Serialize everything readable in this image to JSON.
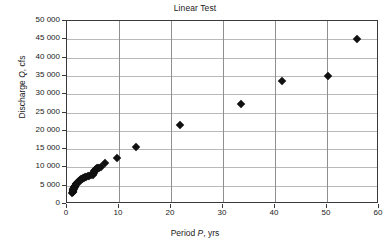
{
  "chart_data": {
    "type": "scatter",
    "title": "Linear Test",
    "xlabel": "Period P, yrs",
    "xlabel_parts": {
      "pre": "Period ",
      "italic": "P",
      "post": ", yrs"
    },
    "ylabel": "Discharge Q, cfs",
    "ylabel_parts": {
      "pre": "Discharge ",
      "italic": "Q",
      "post": ", cfs"
    },
    "xlim": [
      0,
      60
    ],
    "ylim": [
      0,
      50000
    ],
    "xticks": [
      0,
      10,
      20,
      30,
      40,
      50,
      60
    ],
    "xtick_labels": [
      "0",
      "10",
      "20",
      "30",
      "40",
      "50",
      "60"
    ],
    "yticks": [
      0,
      5000,
      10000,
      15000,
      20000,
      25000,
      30000,
      35000,
      40000,
      45000,
      50000
    ],
    "ytick_labels": [
      "0",
      "5 000",
      "10 000",
      "15 000",
      "20 000",
      "25 000",
      "30 000",
      "35 000",
      "40 000",
      "45 000",
      "50 000"
    ],
    "grid": true,
    "grid_horizontal": true,
    "grid_vertical": true,
    "legend": false,
    "marker": "diamond",
    "marker_color": "#111111",
    "series": [
      {
        "name": "Discharge vs Period",
        "points": [
          [
            1.02,
            3000
          ],
          [
            1.06,
            3200
          ],
          [
            1.09,
            3400
          ],
          [
            1.12,
            3550
          ],
          [
            1.16,
            3700
          ],
          [
            1.2,
            3850
          ],
          [
            1.24,
            4000
          ],
          [
            1.28,
            4150
          ],
          [
            1.33,
            4300
          ],
          [
            1.38,
            4450
          ],
          [
            1.43,
            4600
          ],
          [
            1.48,
            4750
          ],
          [
            1.54,
            4900
          ],
          [
            1.6,
            5050
          ],
          [
            1.67,
            5200
          ],
          [
            1.74,
            5350
          ],
          [
            1.82,
            5500
          ],
          [
            1.9,
            5650
          ],
          [
            2.0,
            5800
          ],
          [
            2.1,
            5950
          ],
          [
            2.2,
            6100
          ],
          [
            2.32,
            6250
          ],
          [
            2.44,
            6400
          ],
          [
            2.58,
            6550
          ],
          [
            2.73,
            6700
          ],
          [
            2.89,
            6850
          ],
          [
            3.07,
            7000
          ],
          [
            3.26,
            7150
          ],
          [
            3.47,
            7300
          ],
          [
            3.71,
            7450
          ],
          [
            3.97,
            7600
          ],
          [
            4.26,
            7750
          ],
          [
            4.58,
            7900
          ],
          [
            4.95,
            8050
          ],
          [
            5.0,
            8300
          ],
          [
            5.1,
            8600
          ],
          [
            5.2,
            8900
          ],
          [
            5.3,
            9150
          ],
          [
            5.45,
            9400
          ],
          [
            5.6,
            9600
          ],
          [
            5.8,
            9750
          ],
          [
            6.0,
            9850
          ],
          [
            6.2,
            9950
          ],
          [
            6.5,
            10050
          ],
          [
            7.4,
            11300
          ],
          [
            9.6,
            12500
          ],
          [
            13.3,
            15700
          ],
          [
            21.7,
            21600
          ],
          [
            33.5,
            27200
          ],
          [
            41.3,
            33600
          ],
          [
            50.1,
            35100
          ],
          [
            55.8,
            45100
          ]
        ]
      }
    ]
  }
}
